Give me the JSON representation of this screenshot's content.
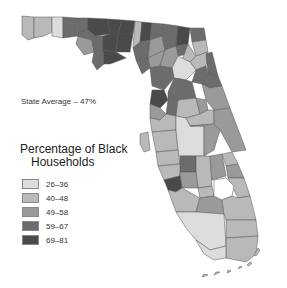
{
  "map": {
    "subject": "Florida counties",
    "state_average_label": "State Average – 47%",
    "legend": {
      "title_line1": "Percentage of Black",
      "title_line2": "Households",
      "items": [
        {
          "label": "26–36",
          "color": "#dcdcdc"
        },
        {
          "label": "40–48",
          "color": "#b9b9b9"
        },
        {
          "label": "49–58",
          "color": "#9a9a9a"
        },
        {
          "label": "59–67",
          "color": "#6c6c6c"
        },
        {
          "label": "69–81",
          "color": "#4a4a4a"
        }
      ]
    }
  }
}
